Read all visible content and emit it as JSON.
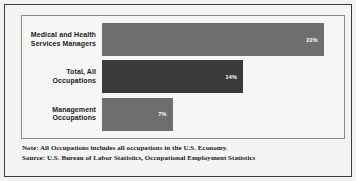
{
  "chart_data": {
    "type": "bar",
    "orientation": "horizontal",
    "title": "",
    "subtitle": "",
    "xlabel": "",
    "ylabel": "",
    "grid": false,
    "legend": null,
    "xlim": [
      0,
      24
    ],
    "categories": [
      "Medical and Health Services Managers",
      "Total, All Occupations",
      "Management Occupations"
    ],
    "values": [
      22,
      14,
      7
    ],
    "value_labels": [
      "22%",
      "14%",
      "7%"
    ],
    "bar_colors": [
      "#6e6e6e",
      "#3a3a3a",
      "#6e6e6e"
    ],
    "bars": [
      {
        "label_line1": "Medical and Health",
        "label_line2": "Services Managers",
        "value": 22,
        "value_label": "22%",
        "color": "#6e6e6e"
      },
      {
        "label_line1": "Total, All",
        "label_line2": "Occupations",
        "value": 14,
        "value_label": "14%",
        "color": "#3a3a3a"
      },
      {
        "label_line1": "Management",
        "label_line2": "Occupations",
        "value": 7,
        "value_label": "7%",
        "color": "#6e6e6e"
      }
    ],
    "annotations": [
      "Note: All Occupations includes all occupations in the U.S. Economy.",
      "Source: U.S. Bureau of Labor Statistics, Occupational Employment Statistics"
    ]
  },
  "footnotes": {
    "note": "Note: All Occupations includes all occupations in the U.S. Economy.",
    "source": "Source: U.S. Bureau of Labor Statistics, Occupational Employment Statistics"
  },
  "colors": {
    "bar_light": "#6e6e6e",
    "bar_dark": "#3a3a3a",
    "frame": "#3d3d3d",
    "plot_border": "#8d8d8d",
    "background": "#f4f4f2",
    "text": "#1a1a1a"
  }
}
